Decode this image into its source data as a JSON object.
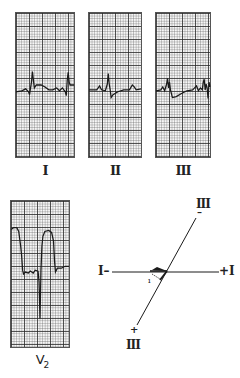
{
  "leads": {
    "I": {
      "label": "I"
    },
    "II": {
      "label": "II"
    },
    "III": {
      "label": "III"
    },
    "V2": {
      "label": "V",
      "subscript": "2"
    }
  },
  "axis_diagram": {
    "lead_I_negative": "I–",
    "lead_I_positive": "+I",
    "lead_III_negative_label": "III",
    "lead_III_negative_sign": "–",
    "lead_III_positive_label": "III",
    "lead_III_positive_sign": "+",
    "vector_tick": "ı"
  },
  "colors": {
    "trace": "#1a1a1a",
    "grid": "#444444",
    "paper": "#f6f6f6"
  }
}
